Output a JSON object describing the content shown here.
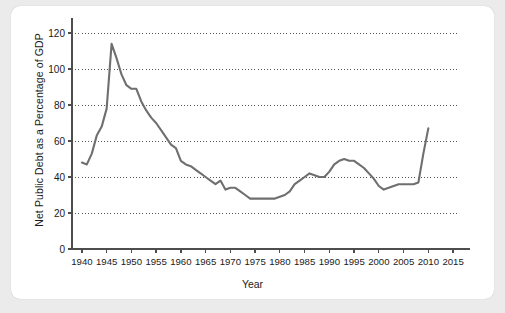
{
  "chart_data": {
    "type": "line",
    "title": "",
    "xlabel": "Year",
    "ylabel": "Net Public Debt as a Percentage of GDP",
    "xlim": [
      1938,
      2016
    ],
    "ylim": [
      0,
      125
    ],
    "grid": true,
    "legend_position": "none",
    "line_color": "#6f6f6f",
    "axis_color": "#4d4d4d",
    "xticks": [
      1940,
      1945,
      1950,
      1955,
      1960,
      1965,
      1970,
      1975,
      1980,
      1985,
      1990,
      1995,
      2000,
      2005,
      2010,
      2015
    ],
    "xtick_labels": [
      "1940",
      "1945",
      "1950",
      "1955",
      "1960",
      "1965",
      "1970",
      "1975",
      "1980",
      "1985",
      "1990",
      "1995",
      "2000",
      "2005",
      "2010",
      "2015"
    ],
    "yticks": [
      0,
      20,
      40,
      60,
      80,
      100,
      120
    ],
    "ytick_labels": [
      "0",
      "20",
      "40",
      "60",
      "80",
      "100",
      "120"
    ],
    "x": [
      1940,
      1941,
      1942,
      1943,
      1944,
      1945,
      1946,
      1947,
      1948,
      1949,
      1950,
      1951,
      1952,
      1953,
      1954,
      1955,
      1956,
      1957,
      1958,
      1959,
      1960,
      1961,
      1962,
      1963,
      1964,
      1965,
      1966,
      1967,
      1968,
      1969,
      1970,
      1971,
      1972,
      1973,
      1974,
      1975,
      1976,
      1977,
      1978,
      1979,
      1980,
      1981,
      1982,
      1983,
      1984,
      1985,
      1986,
      1987,
      1988,
      1989,
      1990,
      1991,
      1992,
      1993,
      1994,
      1995,
      1996,
      1997,
      1998,
      1999,
      2000,
      2001,
      2002,
      2003,
      2004,
      2005,
      2006,
      2007,
      2008,
      2009,
      2010
    ],
    "values": [
      48,
      47,
      53,
      63,
      68,
      78,
      114,
      106,
      97,
      91,
      89,
      89,
      82,
      77,
      73,
      70,
      66,
      62,
      58,
      56,
      49,
      47,
      46,
      44,
      42,
      40,
      38,
      36,
      38,
      33,
      34,
      34,
      32,
      30,
      28,
      28,
      28,
      28,
      28,
      28,
      29,
      30,
      32,
      36,
      38,
      40,
      42,
      41,
      40,
      40,
      43,
      47,
      49,
      50,
      49,
      49,
      47,
      45,
      42,
      39,
      35,
      33,
      34,
      35,
      36,
      36,
      36,
      36,
      37,
      53,
      67
    ],
    "annotations": []
  },
  "axis_titles": {
    "x": "Year",
    "y": "Net Public Debt as a Percentage of GDP"
  }
}
